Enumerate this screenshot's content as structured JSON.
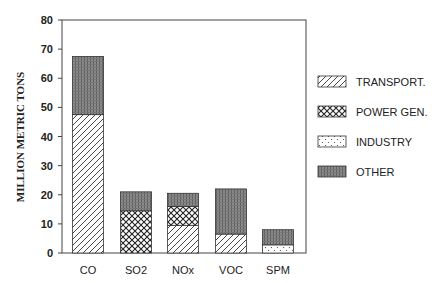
{
  "chart_data": {
    "type": "bar",
    "stacked": true,
    "title": "",
    "xlabel": "",
    "ylabel": "MILLION METRIC TONS",
    "ylim": [
      0,
      80
    ],
    "yticks": [
      0,
      10,
      20,
      30,
      40,
      50,
      60,
      70,
      80
    ],
    "grid": false,
    "legend_position": "right",
    "categories": [
      "CO",
      "SO2",
      "NOx",
      "VOC",
      "SPM"
    ],
    "series": [
      {
        "name": "TRANSPORT.",
        "pattern": "diagonal-hatch",
        "values": [
          47.5,
          0,
          9.5,
          6.5,
          0
        ]
      },
      {
        "name": "POWER GEN.",
        "pattern": "crosshatch",
        "values": [
          0,
          14.5,
          6.5,
          0,
          0
        ]
      },
      {
        "name": "INDUSTRY",
        "pattern": "dots",
        "values": [
          0,
          0,
          0,
          0,
          2.8
        ]
      },
      {
        "name": "OTHER",
        "pattern": "dense-gray",
        "values": [
          20.0,
          6.5,
          4.5,
          15.5,
          5.2
        ]
      }
    ]
  },
  "legend": {
    "items": [
      "TRANSPORT.",
      "POWER GEN.",
      "INDUSTRY",
      "OTHER"
    ]
  }
}
